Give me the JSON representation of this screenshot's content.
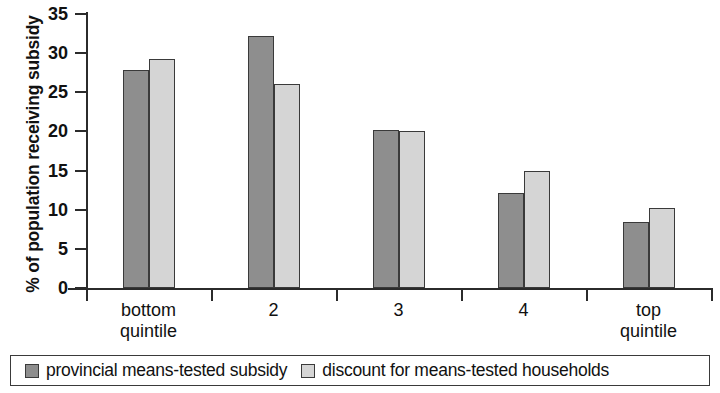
{
  "chart_data": {
    "type": "bar",
    "title": "",
    "subtitle": "",
    "xlabel": "",
    "ylabel": "% of population receiving subsidy",
    "ylim": [
      0,
      35
    ],
    "yticks": [
      0,
      5,
      10,
      15,
      20,
      25,
      30,
      35
    ],
    "ytick_labels": [
      "0",
      "5",
      "10",
      "15",
      "20",
      "25",
      "30",
      "35"
    ],
    "grid": false,
    "legend_position": "bottom",
    "categories": [
      "bottom\nquintile",
      "2",
      "3",
      "4",
      "top\nquintile"
    ],
    "series": [
      {
        "name": "provincial means-tested subsidy",
        "color": "#8e8e8e",
        "values": [
          27.8,
          32.2,
          20.2,
          12.1,
          8.4
        ]
      },
      {
        "name": "discount for means-tested households",
        "color": "#d5d5d5",
        "values": [
          29.2,
          26.1,
          20.1,
          15.0,
          10.2
        ]
      }
    ]
  },
  "legend": {
    "entries": [
      {
        "label": "provincial means-tested subsidy"
      },
      {
        "label": "discount for means-tested households"
      }
    ]
  },
  "colors": {
    "series_dark": "#8e8e8e",
    "series_light": "#d5d5d5",
    "axis": "#2b2b2b",
    "background": "#ffffff"
  }
}
